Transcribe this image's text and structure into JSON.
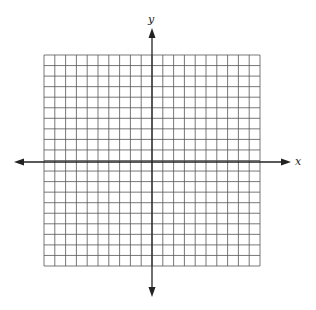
{
  "figure": {
    "type": "coordinate-grid",
    "x_axis_label": "x",
    "y_axis_label": "y",
    "grid": {
      "columns": 20,
      "rows": 20,
      "x_range": [
        -10,
        10
      ],
      "y_range": [
        -10,
        10
      ],
      "tick_labels": "none"
    },
    "colors": {
      "background": "#ffffff",
      "grid_line": "#555555",
      "axis": "#222222"
    }
  }
}
